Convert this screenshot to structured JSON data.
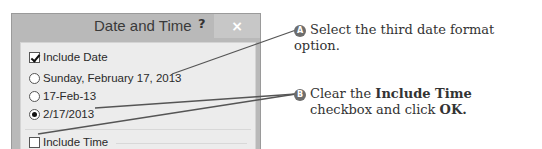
{
  "dialog": {
    "title": "Date and Time",
    "help_label": "?",
    "close_label": "×",
    "include_date": {
      "label": "Include Date",
      "checked": true
    },
    "date_formats": [
      {
        "label": "Sunday, February 17, 2013",
        "selected": false
      },
      {
        "label": "17-Feb-13",
        "selected": false
      },
      {
        "label": "2/17/2013",
        "selected": true
      }
    ],
    "include_time": {
      "label": "Include Time",
      "checked": false
    }
  },
  "callouts": [
    {
      "badge": "A",
      "text": "Select the third date format option."
    },
    {
      "badge": "B",
      "text_pre": "Clear the ",
      "bold1": "Include Time",
      "text_mid": "checkbox and click ",
      "bold2": "OK."
    }
  ],
  "colors": {
    "frame": "#b9b9b9",
    "client": "#ececec",
    "badge": "#6d6d6d",
    "leader_line": "#555555"
  }
}
